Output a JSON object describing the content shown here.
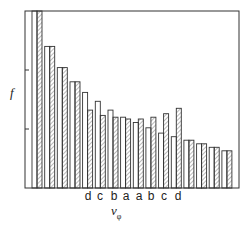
{
  "chart_data": {
    "type": "bar",
    "title": "",
    "xlabel": "v_φ",
    "ylabel": "f",
    "ylim": [
      0,
      100
    ],
    "grid": false,
    "legend": null,
    "y_ticks_relative": [
      33,
      67
    ],
    "y_tick_labels": [],
    "category_labels": [
      {
        "pair": 5,
        "label": "d"
      },
      {
        "pair": 6,
        "label": "c"
      },
      {
        "pair": 7,
        "label": "b"
      },
      {
        "pair": 8,
        "label": "a"
      },
      {
        "pair": 9,
        "label": "a"
      },
      {
        "pair": 10,
        "label": "b"
      },
      {
        "pair": 11,
        "label": "c"
      },
      {
        "pair": 12,
        "label": "d"
      }
    ],
    "categories": [
      "1",
      "2",
      "3",
      "4",
      "5 (d)",
      "6 (c)",
      "7 (b)",
      "8 (a)",
      "9 (a)",
      "10 (b)",
      "11 (c)",
      "12 (d)",
      "13",
      "14",
      "15",
      "16"
    ],
    "series": [
      {
        "name": "open",
        "style": "white fill",
        "values": [
          100,
          80,
          68,
          60,
          54,
          49,
          44,
          40,
          37,
          34,
          31,
          29,
          27,
          25,
          23,
          21
        ]
      },
      {
        "name": "hatched",
        "style": "diagonal hatch",
        "values": [
          100,
          80,
          68,
          60,
          44,
          41,
          40,
          39,
          39,
          40,
          42,
          45,
          27,
          25,
          23,
          21
        ]
      }
    ]
  },
  "labels": {
    "y": "f",
    "x_main": "v",
    "x_sub": "φ",
    "cats": [
      "d",
      "c",
      "b",
      "a",
      "a",
      "b",
      "c",
      "d"
    ]
  },
  "colors": {
    "line": "#333333",
    "hatch": "#555555",
    "background": "#ffffff"
  }
}
